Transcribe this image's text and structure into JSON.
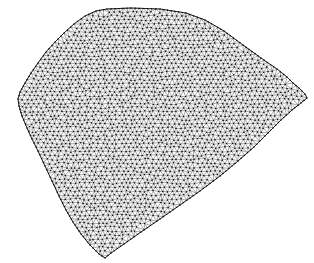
{
  "figure": {
    "kind": "finite-element-mesh",
    "width": 314,
    "height": 263,
    "background_color": "#ffffff",
    "edge_color": "#1a1a1a",
    "node_color": "#000000",
    "outline_color": "#000000",
    "caption_cropped_text": "...........",
    "caption_color": "#e9e9ec"
  },
  "chart_data": {
    "type": "diagram",
    "title": "",
    "xlabel": "",
    "ylabel": "",
    "mesh": {
      "element_type": "triangle",
      "target_edge_length": 4.6,
      "boundary_refinement": 0.85,
      "show_nodes": true,
      "node_radius": 0.55,
      "boundary_polygon": [
        [
          107,
          9
        ],
        [
          131,
          8
        ],
        [
          160,
          9
        ],
        [
          186,
          13
        ],
        [
          205,
          20
        ],
        [
          224,
          31
        ],
        [
          243,
          45
        ],
        [
          261,
          58
        ],
        [
          277,
          69
        ],
        [
          287,
          77
        ],
        [
          293,
          83
        ],
        [
          299,
          88
        ],
        [
          305,
          94
        ],
        [
          307,
          98
        ],
        [
          301,
          103
        ],
        [
          292,
          110
        ],
        [
          281,
          120
        ],
        [
          268,
          133
        ],
        [
          254,
          147
        ],
        [
          238,
          161
        ],
        [
          220,
          176
        ],
        [
          200,
          191
        ],
        [
          180,
          205
        ],
        [
          160,
          219
        ],
        [
          141,
          232
        ],
        [
          124,
          244
        ],
        [
          111,
          253
        ],
        [
          105,
          258
        ],
        [
          99,
          254
        ],
        [
          90,
          245
        ],
        [
          81,
          234
        ],
        [
          73,
          222
        ],
        [
          66,
          210
        ],
        [
          59,
          196
        ],
        [
          52,
          181
        ],
        [
          45,
          166
        ],
        [
          38,
          151
        ],
        [
          32,
          139
        ],
        [
          27,
          128
        ],
        [
          22,
          116
        ],
        [
          19,
          106
        ],
        [
          18,
          99
        ],
        [
          20,
          92
        ],
        [
          25,
          83
        ],
        [
          31,
          73
        ],
        [
          38,
          63
        ],
        [
          46,
          52
        ],
        [
          55,
          42
        ],
        [
          64,
          33
        ],
        [
          74,
          24
        ],
        [
          85,
          16
        ],
        [
          96,
          11
        ]
      ]
    }
  }
}
